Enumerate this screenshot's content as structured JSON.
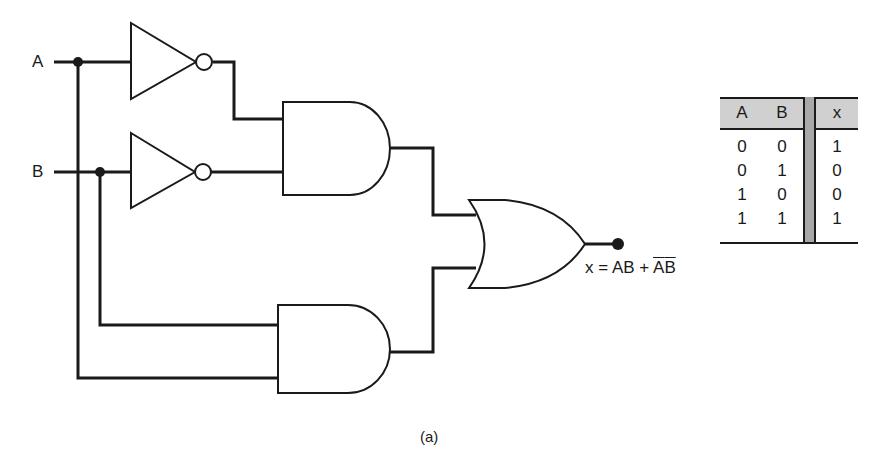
{
  "diagram": {
    "type": "logic-circuit",
    "inputs": [
      {
        "label": "A"
      },
      {
        "label": "B"
      }
    ],
    "gates": [
      {
        "id": "not1",
        "type": "NOT",
        "input": "A"
      },
      {
        "id": "not2",
        "type": "NOT",
        "input": "B"
      },
      {
        "id": "and1",
        "type": "AND",
        "inputs": [
          "not1",
          "not2"
        ]
      },
      {
        "id": "and2",
        "type": "AND",
        "inputs": [
          "B",
          "A"
        ]
      },
      {
        "id": "or1",
        "type": "OR",
        "inputs": [
          "and1",
          "and2"
        ],
        "output": "x"
      }
    ],
    "output_expression": {
      "prefix": "x = AB + ",
      "overlined_a": "A",
      "overlined_b": "B"
    },
    "caption": "(a)"
  },
  "truth_table": {
    "headers": [
      "A",
      "B",
      "x"
    ],
    "rows": [
      [
        "0",
        "0",
        "1"
      ],
      [
        "0",
        "1",
        "0"
      ],
      [
        "1",
        "0",
        "0"
      ],
      [
        "1",
        "1",
        "1"
      ]
    ],
    "header_bg": "#d0d0d0",
    "separator_bg": "#a8a8a8"
  }
}
